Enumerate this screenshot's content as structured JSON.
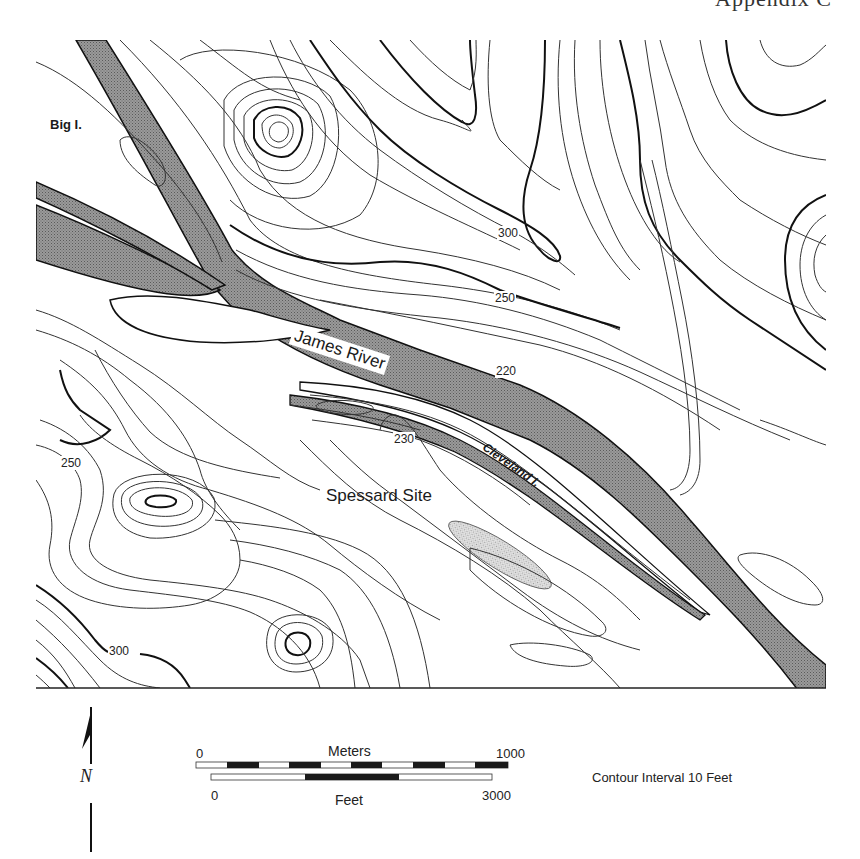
{
  "header": {
    "text": "Appendix C"
  },
  "map": {
    "labels": {
      "big_island": "Big I.",
      "james_river": "James River",
      "cleveland_island": "Cleveland I.",
      "spessard_site": "Spessard Site"
    },
    "contour_labels": [
      {
        "value": "300",
        "x": 497,
        "y": 226
      },
      {
        "value": "250",
        "x": 494,
        "y": 291
      },
      {
        "value": "220",
        "x": 495,
        "y": 364
      },
      {
        "value": "230",
        "x": 393,
        "y": 432
      },
      {
        "value": "250",
        "x": 60,
        "y": 456
      },
      {
        "value": "300",
        "x": 108,
        "y": 644
      }
    ],
    "colors": {
      "river_fill": "#8c8c8c",
      "site_fill": "#c4c4c4",
      "contour_line": "#333333",
      "index_contour": "#111111"
    }
  },
  "legend": {
    "north_letter": "N",
    "scale_meters": {
      "title": "Meters",
      "start": "0",
      "end": "1000"
    },
    "scale_feet": {
      "title": "Feet",
      "start": "0",
      "end": "3000"
    },
    "contour_interval": "Contour Interval 10 Feet"
  }
}
